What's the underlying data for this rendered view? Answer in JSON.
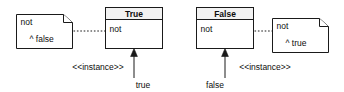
{
  "diagram": {
    "stroke_color": "#1a1a1a",
    "text_color": "#0d0d0d",
    "background_color": "#ffffff",
    "left": {
      "note": {
        "line1": "not",
        "line2": "^ false"
      },
      "class_box": {
        "name": "True",
        "feature": "not"
      },
      "link_stereotype": "<<instance>>",
      "instance_label": "true"
    },
    "right": {
      "class_box": {
        "name": "False",
        "feature": "not"
      },
      "note": {
        "line1": "not",
        "line2": "^ true"
      },
      "link_stereotype": "<<instance>>",
      "instance_label": "false"
    }
  }
}
